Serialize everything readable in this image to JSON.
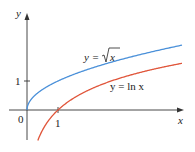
{
  "chart_data": {
    "type": "line",
    "title": "",
    "xlabel": "x",
    "ylabel": "y",
    "xlim": [
      0,
      5
    ],
    "ylim": [
      -1.1,
      2.5
    ],
    "grid": false,
    "x_ticks": [
      {
        "value": 0,
        "label": "0"
      },
      {
        "value": 1,
        "label": "1"
      }
    ],
    "y_ticks": [
      {
        "value": 1,
        "label": "1"
      }
    ],
    "series": [
      {
        "name": "y = √x",
        "color": "#4a90d9",
        "x": [
          0,
          0.1,
          0.25,
          0.5,
          1,
          2,
          3,
          4,
          5
        ],
        "values": [
          0,
          0.316,
          0.5,
          0.707,
          1,
          1.414,
          1.732,
          2,
          2.236
        ]
      },
      {
        "name": "y = ln x",
        "color": "#e0553a",
        "x": [
          0.35,
          0.5,
          1,
          2,
          3,
          4,
          5
        ],
        "values": [
          -1.05,
          -0.693,
          0,
          0.693,
          1.099,
          1.386,
          1.609
        ]
      }
    ],
    "annotations": [
      {
        "text": "y = √x",
        "near_series": "y = √x"
      },
      {
        "text": "y = ln x",
        "near_series": "y = ln x"
      }
    ]
  },
  "labels": {
    "y_axis": "y",
    "x_axis": "x",
    "origin": "0",
    "x_tick_1": "1",
    "y_tick_1": "1",
    "sqrt_prefix": "y =",
    "sqrt_arg": "x",
    "ln_label": "y = ln x"
  }
}
